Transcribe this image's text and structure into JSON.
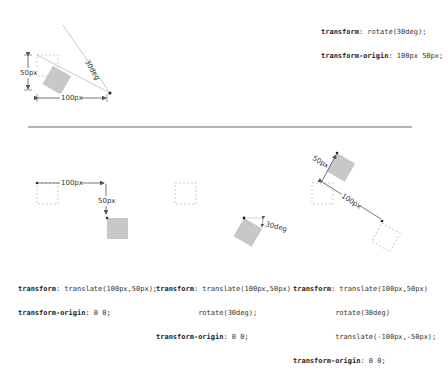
{
  "top": {
    "code": [
      {
        "prop": "transform",
        "value": " rotate(30deg);"
      },
      {
        "prop": "transform-origin",
        "value": " 100px 50px;"
      }
    ],
    "labels": {
      "height": "50px",
      "width": "100px",
      "angle": "30deg"
    }
  },
  "panels": [
    {
      "labels": {
        "x": "100px",
        "y": "50px"
      },
      "code": [
        {
          "prop": "transform",
          "value": " translate(100px,50px);"
        },
        {
          "prop": "",
          "value": ""
        },
        {
          "prop": "transform-origin",
          "value": " 0 0;"
        }
      ]
    },
    {
      "labels": {
        "angle": "30deg"
      },
      "code": [
        {
          "prop": "transform",
          "value": " translate(100px,50px)"
        },
        {
          "prop": "",
          "value": "          rotate(30deg);"
        },
        {
          "prop": "transform-origin",
          "value": " 0 0;"
        }
      ]
    },
    {
      "labels": {
        "y": "50px",
        "x": "100px"
      },
      "code": [
        {
          "prop": "transform",
          "value": " translate(100px,50px)"
        },
        {
          "prop": "",
          "value": "          rotate(30deg)"
        },
        {
          "prop": "",
          "value": "          translate(-100px,-50px);"
        },
        {
          "prop": "transform-origin",
          "value": " 0 0;"
        }
      ]
    }
  ],
  "colors": {
    "box": "#c8c8c8",
    "dashed": "#cccccc",
    "line": "#555555",
    "separator": "#666666"
  }
}
